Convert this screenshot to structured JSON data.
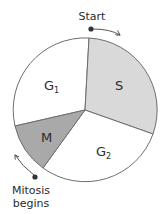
{
  "diagram": {
    "colors": {
      "outline": "#6e6e6e",
      "s_fill": "#d9d9d9",
      "m_fill": "#a9a9a9",
      "g_fill": "#ffffff",
      "text": "#2b2b2b"
    },
    "phases": [
      {
        "id": "G1",
        "label": "G",
        "subscript": "1",
        "fill": "white"
      },
      {
        "id": "S",
        "label": "S",
        "fill": "light-gray"
      },
      {
        "id": "G2",
        "label": "G",
        "subscript": "2",
        "fill": "white"
      },
      {
        "id": "M",
        "label": "M",
        "fill": "dark-gray"
      }
    ],
    "annotations": {
      "start": "Start",
      "mitosis_line1": "Mitosis",
      "mitosis_line2": "begins"
    }
  }
}
